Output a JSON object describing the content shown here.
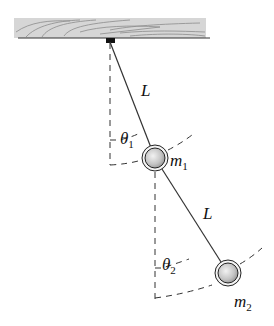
{
  "diagram": {
    "labels": {
      "length_upper": "L",
      "length_lower": "L",
      "angle1": {
        "symbol": "θ",
        "sub": "1"
      },
      "angle2": {
        "symbol": "θ",
        "sub": "2"
      },
      "mass1": {
        "symbol": "m",
        "sub": "1"
      },
      "mass2": {
        "symbol": "m",
        "sub": "2"
      }
    },
    "colors": {
      "ceiling": "#d4d4d4",
      "grain": "#8a8a8a",
      "rod": "#333333",
      "mass": "#c8c8c8"
    }
  }
}
